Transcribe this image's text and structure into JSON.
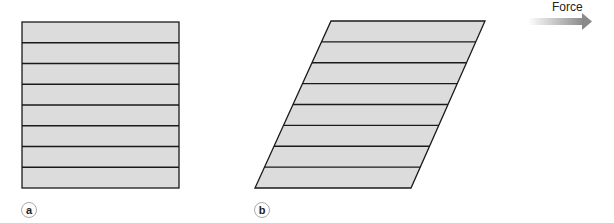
{
  "diagram": {
    "panels": [
      {
        "id": "a",
        "label": "a",
        "shape": "rectangle",
        "layers": 8,
        "description": "Unsheared stack of layers"
      },
      {
        "id": "b",
        "label": "b",
        "shape": "parallelogram",
        "layers": 8,
        "description": "Sheared stack of layers"
      }
    ],
    "force": {
      "label": "Force",
      "direction": "right"
    },
    "colors": {
      "fill": "#dcdcdc",
      "stroke": "#1a1a1a",
      "arrow_start": "#ffffff",
      "arrow_end": "#8a8a8a"
    }
  }
}
